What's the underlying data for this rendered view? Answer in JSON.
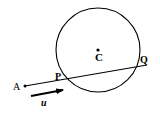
{
  "diagram": {
    "title": "",
    "colors": {
      "stroke": "#000000",
      "background": "#ffffff"
    },
    "circle": {
      "cx": 98,
      "cy": 50,
      "r": 42,
      "center_label": "C"
    },
    "points": {
      "A": {
        "label": "A",
        "x": 25,
        "y": 86
      },
      "P": {
        "label": "P",
        "x": 67,
        "y": 78
      },
      "Q": {
        "label": "Q",
        "x": 137,
        "y": 67
      },
      "C": {
        "label": "C",
        "x": 98,
        "y": 50
      }
    },
    "line": {
      "from": "A",
      "through": [
        "P",
        "Q"
      ],
      "x1": 25,
      "y1": 86,
      "x2": 147,
      "y2": 65
    },
    "direction_vector": {
      "label": "u",
      "x1": 31,
      "y1": 96,
      "x2": 62,
      "y2": 90
    }
  }
}
